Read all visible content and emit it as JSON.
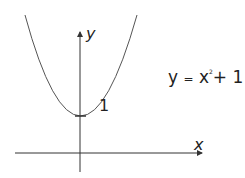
{
  "diagram": {
    "equation": {
      "lhs": "y",
      "eq": "=",
      "base": "x",
      "exponent": "2",
      "rest": "+ 1"
    },
    "axes": {
      "x_label": "x",
      "y_label": "y"
    },
    "annotations": {
      "y_intercept_label": "1"
    },
    "colors": {
      "curve": "#555555",
      "axes": "#333333",
      "text": "#222222"
    }
  }
}
